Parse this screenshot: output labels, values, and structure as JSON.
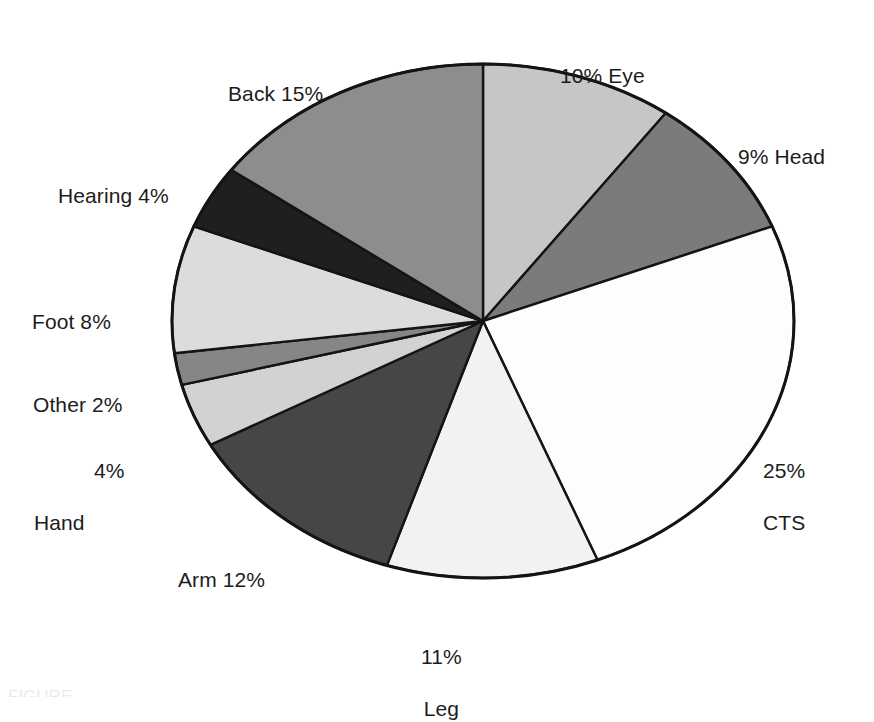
{
  "figure": {
    "caption_fragment": "FIGURE",
    "background_color": "#ffffff",
    "outline_color": "#141414"
  },
  "chart_data": {
    "type": "pie",
    "title": "",
    "subtitle": "",
    "xlabel": "",
    "ylabel": "",
    "grid": false,
    "legend_position": "none",
    "label_format": "percent_with_category",
    "start_angle_deg": 0,
    "direction": "clockwise",
    "total_percent": 100,
    "center": {
      "x": 483,
      "y": 321
    },
    "radius_x": 311,
    "radius_y": 257,
    "categories": [
      "Eye",
      "Head",
      "CTS",
      "Leg",
      "Arm",
      "Hand",
      "Other",
      "Foot",
      "Hearing",
      "Back"
    ],
    "values": [
      10,
      9,
      25,
      11,
      12,
      4,
      2,
      8,
      4,
      15
    ],
    "slices": [
      {
        "name": "Eye",
        "value": 10,
        "percent_text": "10%",
        "label_text": "10% Eye",
        "label_lines": [
          "10% Eye"
        ],
        "fill": "#c6c6c6",
        "start_pct": 0,
        "end_pct": 10
      },
      {
        "name": "Head",
        "value": 9,
        "percent_text": "9%",
        "label_text": "9% Head",
        "label_lines": [
          "9% Head"
        ],
        "fill": "#7b7b7b",
        "start_pct": 10,
        "end_pct": 19
      },
      {
        "name": "CTS",
        "value": 25,
        "percent_text": "25%",
        "label_text": "25% CTS",
        "label_lines": [
          "25%",
          "CTS"
        ],
        "fill": "#fdfdfd",
        "start_pct": 19,
        "end_pct": 44
      },
      {
        "name": "Leg",
        "value": 11,
        "percent_text": "11%",
        "label_text": "11% Leg",
        "label_lines": [
          "11%",
          "Leg"
        ],
        "fill": "#f2f2f2",
        "start_pct": 44,
        "end_pct": 55
      },
      {
        "name": "Arm",
        "value": 12,
        "percent_text": "12%",
        "label_text": "Arm 12%",
        "label_lines": [
          "Arm 12%"
        ],
        "fill": "#464646",
        "start_pct": 55,
        "end_pct": 67
      },
      {
        "name": "Hand",
        "value": 4,
        "percent_text": "4%",
        "label_text": "4% Hand",
        "label_lines": [
          "4%",
          "Hand"
        ],
        "fill": "#d2d2d2",
        "start_pct": 67,
        "end_pct": 71
      },
      {
        "name": "Other",
        "value": 2,
        "percent_text": "2%",
        "label_text": "Other 2%",
        "label_lines": [
          "Other 2%"
        ],
        "fill": "#868686",
        "start_pct": 71,
        "end_pct": 73
      },
      {
        "name": "Foot",
        "value": 8,
        "percent_text": "8%",
        "label_text": "Foot 8%",
        "label_lines": [
          "Foot 8%"
        ],
        "fill": "#dcdcdc",
        "start_pct": 73,
        "end_pct": 81
      },
      {
        "name": "Hearing",
        "value": 4,
        "percent_text": "4%",
        "label_text": "Hearing 4%",
        "label_lines": [
          "Hearing 4%"
        ],
        "fill": "#1f1f1f",
        "start_pct": 81,
        "end_pct": 85
      },
      {
        "name": "Back",
        "value": 15,
        "percent_text": "15%",
        "label_text": "Back 15%",
        "label_lines": [
          "Back 15%"
        ],
        "fill": "#8d8d8d",
        "start_pct": 85,
        "end_pct": 100
      }
    ]
  }
}
